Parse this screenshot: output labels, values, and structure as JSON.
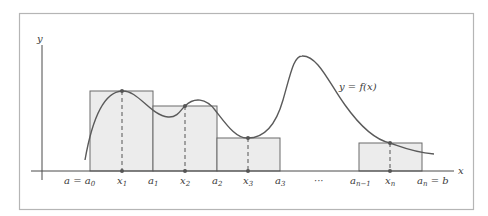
{
  "figure": {
    "curve_label": "y = f(x)",
    "axes": {
      "x_label": "x",
      "y_label": "y"
    },
    "tick_labels": [
      {
        "id": "a0",
        "base": "a = a",
        "sub": "0",
        "tail": ""
      },
      {
        "id": "x1",
        "base": "x",
        "sub": "1",
        "tail": ""
      },
      {
        "id": "a1",
        "base": "a",
        "sub": "1",
        "tail": ""
      },
      {
        "id": "x2",
        "base": "x",
        "sub": "2",
        "tail": ""
      },
      {
        "id": "a2",
        "base": "a",
        "sub": "2",
        "tail": ""
      },
      {
        "id": "x3",
        "base": "x",
        "sub": "3",
        "tail": ""
      },
      {
        "id": "a3",
        "base": "a",
        "sub": "3",
        "tail": ""
      },
      {
        "id": "dots",
        "base": "···",
        "sub": "",
        "tail": ""
      },
      {
        "id": "an1",
        "base": "a",
        "sub": "n−1",
        "tail": ""
      },
      {
        "id": "xn",
        "base": "x",
        "sub": "n",
        "tail": ""
      },
      {
        "id": "an",
        "base": "a",
        "sub": "n",
        "tail": " = b"
      }
    ],
    "rectangles": [
      {
        "from": "a0",
        "to": "a1",
        "sample": "x1"
      },
      {
        "from": "a1",
        "to": "a2",
        "sample": "x2"
      },
      {
        "from": "a2",
        "to": "a3",
        "sample": "x3"
      },
      {
        "from": "an1",
        "to": "an",
        "sample": "xn"
      }
    ],
    "colors": {
      "frame": "#b5b5b5",
      "rect_fill": "#ececec",
      "rect_stroke": "#6a6a6a",
      "curve": "#5a5a5a",
      "axis": "#4a4a4a",
      "text": "#3a3a3a"
    }
  }
}
